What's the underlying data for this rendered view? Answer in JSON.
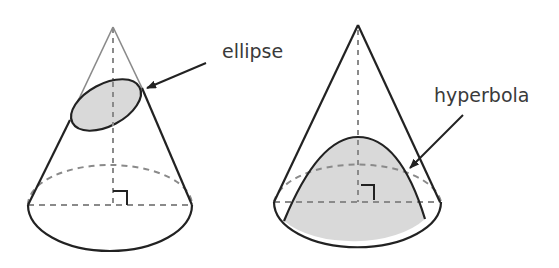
{
  "diagram": {
    "figures": [
      {
        "id": "left-cone",
        "label": "ellipse",
        "section_fill": "#d9d9d9"
      },
      {
        "id": "right-cone",
        "label": "hyperbola",
        "section_fill": "#d9d9d9"
      }
    ],
    "colors": {
      "outline": "#222222",
      "hidden_line": "#8a8a8a",
      "faint_edge": "#8a8a8a",
      "section_fill": "#d9d9d9",
      "text": "#3a3a3a"
    }
  }
}
